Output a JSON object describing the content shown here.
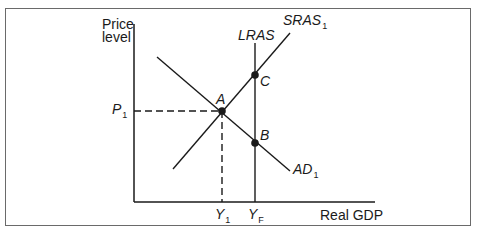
{
  "diagram": {
    "type": "AD-AS model",
    "y_axis_label_line1": "Price",
    "y_axis_label_line2": "level",
    "x_axis_label": "Real GDP",
    "curves": {
      "lras": {
        "name": "LRAS",
        "sub": ""
      },
      "sras": {
        "name": "SRAS",
        "sub": "1"
      },
      "ad": {
        "name": "AD",
        "sub": "1"
      }
    },
    "points": {
      "a": "A",
      "b": "B",
      "c": "C"
    },
    "ticks": {
      "p1": {
        "name": "P",
        "sub": "1"
      },
      "y1": {
        "name": "Y",
        "sub": "1"
      },
      "yf": {
        "name": "Y",
        "sub": "F"
      }
    },
    "colors": {
      "line": "#1a1a1a",
      "frame": "#6a6a6a",
      "background": "#ffffff"
    }
  }
}
